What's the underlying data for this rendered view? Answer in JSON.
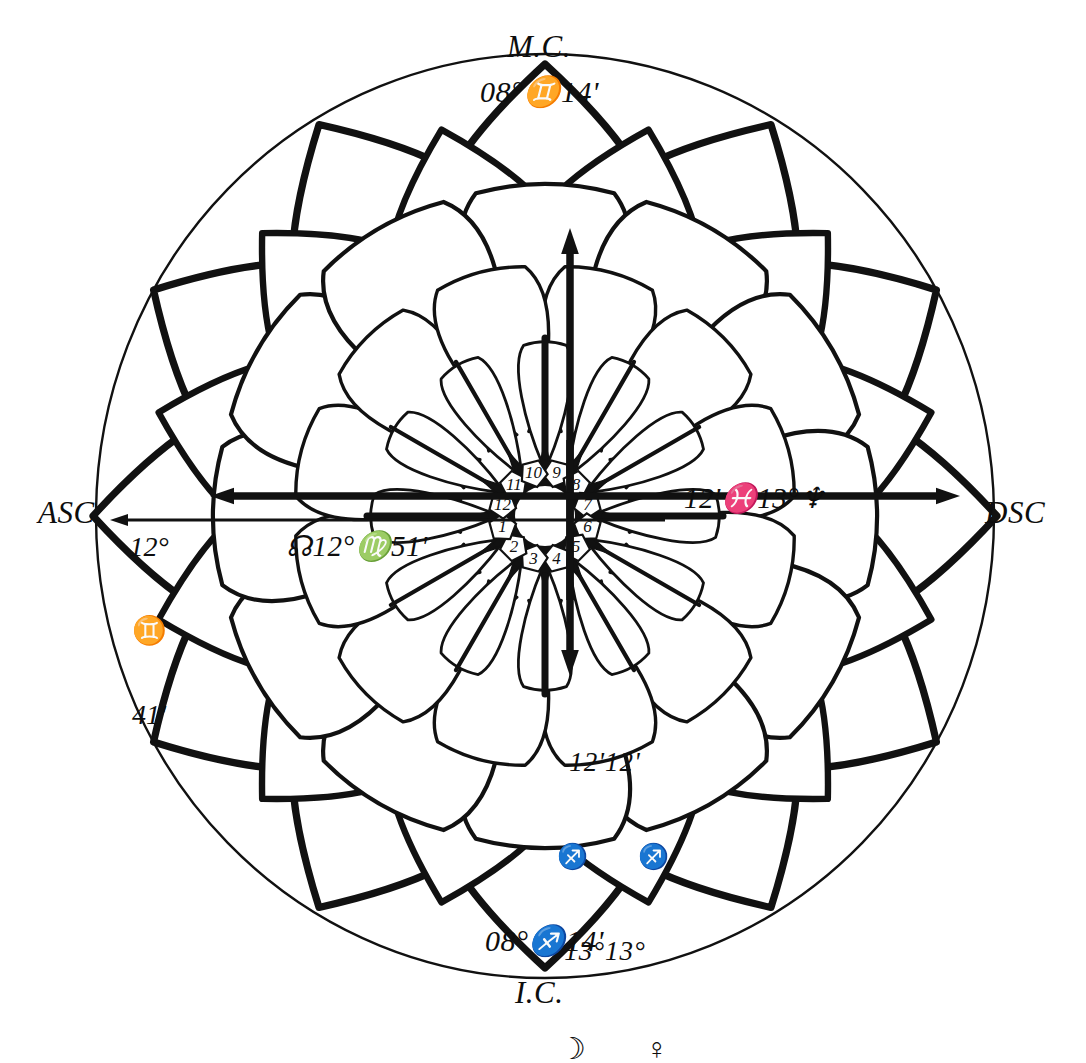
{
  "figure": {
    "kind": "astrological-lotus-chart",
    "background_color": "#ffffff",
    "ink_color": "#111111",
    "width": 1086,
    "height": 1040
  },
  "cardinals": {
    "mc": {
      "name": "M.C.",
      "degree": "08°",
      "sign_glyph": "♊",
      "minute": "14'",
      "text": "08°♊14'"
    },
    "ic": {
      "name": "I.C.",
      "degree": "08°",
      "sign_glyph": "♐",
      "minute": "14'",
      "text": "08°♐14'"
    },
    "asc": {
      "name": "ASC",
      "degree": "12°",
      "sign_glyph": "♊",
      "minute": "41'"
    },
    "dsc": {
      "name": "DSC"
    }
  },
  "axis_labels": {
    "left": {
      "node_glyph": "☊",
      "degree": "12°",
      "sign_glyph": "♍",
      "minute": "51'",
      "text": "☊12°♍51'"
    },
    "right": {
      "minute": "12'",
      "sign_glyph": "♓",
      "degree": "13°",
      "planet_glyph": "♆",
      "text": "12'♓13°♆"
    }
  },
  "planet_cluster_bottom": {
    "minutes": "12'12'",
    "sign_glyphs": "♐ ♐",
    "degrees": "13°13°",
    "planet_glyphs": "☽ ♀",
    "planets": [
      {
        "name": "moon",
        "glyph": "☽",
        "degree": "13°",
        "minute": "12'",
        "sign_glyph": "♐"
      },
      {
        "name": "venus",
        "glyph": "♀",
        "degree": "13°",
        "minute": "12'",
        "sign_glyph": "♐"
      }
    ]
  },
  "house_numbers": [
    "1",
    "2",
    "3",
    "4",
    "5",
    "6",
    "7",
    "8",
    "9",
    "10",
    "11",
    "12"
  ],
  "arrows": {
    "up": "arrow-up",
    "down": "arrow-down",
    "left_upper": "arrow-left",
    "left_lower": "arrow-left",
    "right": "arrow-right"
  }
}
